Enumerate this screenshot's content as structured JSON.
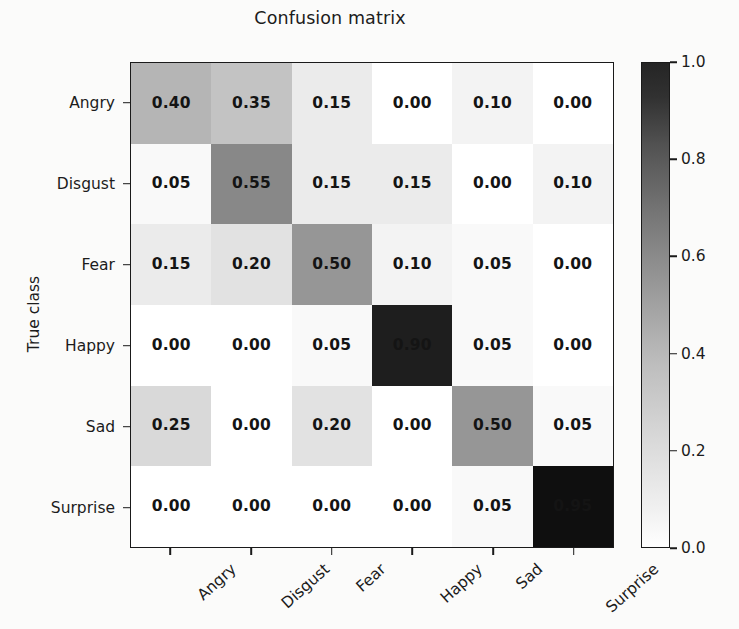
{
  "chart_data": {
    "type": "heatmap",
    "title": "Confusion matrix",
    "xlabel": "",
    "ylabel": "True class",
    "categories": [
      "Angry",
      "Disgust",
      "Fear",
      "Happy",
      "Sad",
      "Surprise"
    ],
    "x_tick_labels": [
      "Angry",
      "Disgust",
      "Fear",
      "Happy",
      "Sad",
      "Surprise"
    ],
    "y_tick_labels": [
      "Angry",
      "Disgust",
      "Fear",
      "Happy",
      "Sad",
      "Surprise"
    ],
    "colormap": "Greys",
    "vmin": 0.0,
    "vmax": 1.0,
    "grid": false,
    "legend_position": "right-colorbar",
    "colorbar": {
      "ticks": [
        0.0,
        0.2,
        0.4,
        0.6,
        0.8,
        1.0
      ],
      "tick_labels": [
        "0.0",
        "0.2",
        "0.4",
        "0.6",
        "0.8",
        "1.0"
      ],
      "low_color": "#ffffff",
      "high_color": "#252525"
    },
    "rows": [
      {
        "label": "Angry",
        "values": [
          0.4,
          0.35,
          0.15,
          0.0,
          0.1,
          0.0
        ]
      },
      {
        "label": "Disgust",
        "values": [
          0.05,
          0.55,
          0.15,
          0.15,
          0.0,
          0.1
        ]
      },
      {
        "label": "Fear",
        "values": [
          0.15,
          0.2,
          0.5,
          0.1,
          0.05,
          0.0
        ]
      },
      {
        "label": "Happy",
        "values": [
          0.0,
          0.0,
          0.05,
          0.9,
          0.05,
          0.0
        ]
      },
      {
        "label": "Sad",
        "values": [
          0.25,
          0.0,
          0.2,
          0.0,
          0.5,
          0.05
        ]
      },
      {
        "label": "Surprise",
        "values": [
          0.0,
          0.0,
          0.0,
          0.0,
          0.05,
          0.95
        ]
      }
    ],
    "cell_labels": [
      [
        "0.40",
        "0.35",
        "0.15",
        "0.00",
        "0.10",
        "0.00"
      ],
      [
        "0.05",
        "0.55",
        "0.15",
        "0.15",
        "0.00",
        "0.10"
      ],
      [
        "0.15",
        "0.20",
        "0.50",
        "0.10",
        "0.05",
        "0.00"
      ],
      [
        "0.00",
        "0.00",
        "0.05",
        "0.90",
        "0.05",
        "0.00"
      ],
      [
        "0.25",
        "0.00",
        "0.20",
        "0.00",
        "0.50",
        "0.05"
      ],
      [
        "0.00",
        "0.00",
        "0.00",
        "0.00",
        "0.05",
        "0.95"
      ]
    ]
  },
  "colors": {
    "text": "#1c1c1c",
    "axis": "#1a1a1a",
    "background": "#fbfbfa"
  }
}
